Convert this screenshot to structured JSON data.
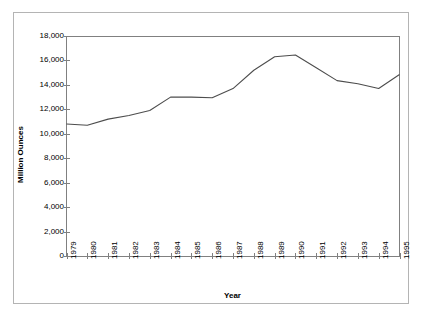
{
  "chart_data": {
    "type": "line",
    "title": "",
    "xlabel": "Year",
    "ylabel": "Million Ounces",
    "categories": [
      "1979",
      "1980",
      "1981",
      "1982",
      "1983",
      "1984",
      "1985",
      "1986",
      "1987",
      "1988",
      "1989",
      "1990",
      "1991",
      "1992",
      "1993",
      "1994",
      "1995"
    ],
    "values": [
      10800,
      10700,
      11200,
      11500,
      11900,
      13000,
      13000,
      12950,
      13700,
      15200,
      16300,
      16450,
      15400,
      14350,
      14100,
      13700,
      14850
    ],
    "series": [
      {
        "name": "Million Ounces",
        "values": [
          10800,
          10700,
          11200,
          11500,
          11900,
          13000,
          13000,
          12950,
          13700,
          15200,
          16300,
          16450,
          15400,
          14350,
          14100,
          13700,
          14850
        ]
      }
    ],
    "ylim": [
      0,
      18000
    ],
    "ytick_labels": [
      "18,000",
      "16,000",
      "14,000",
      "12,000",
      "10,000",
      "8,000",
      "6,000",
      "4,000",
      "2,000",
      "0"
    ],
    "ytick_values": [
      18000,
      16000,
      14000,
      12000,
      10000,
      8000,
      6000,
      4000,
      2000,
      0
    ],
    "grid": false,
    "legend": "none",
    "line_color": "#4d4d4d",
    "axis_color": "#808080",
    "frame_color": "#b4b4b4",
    "background_color": "#ffffff"
  }
}
